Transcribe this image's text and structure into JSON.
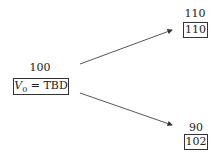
{
  "diagram": {
    "type": "binomial-tree",
    "root": {
      "price_label": "100",
      "value_var": "V",
      "value_sub": "0",
      "value_eq": "= TBD"
    },
    "up": {
      "price_label": "110",
      "value": "110"
    },
    "down": {
      "price_label": "90",
      "value": "102"
    },
    "edges": [
      {
        "from": "root",
        "to": "up"
      },
      {
        "from": "root",
        "to": "down"
      }
    ]
  }
}
